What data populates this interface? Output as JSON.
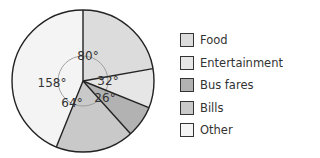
{
  "chart_data": {
    "type": "pie",
    "title": "",
    "unit": "degrees",
    "categories": [
      "Food",
      "Entertainment",
      "Bus fares",
      "Bills",
      "Other"
    ],
    "values": [
      80,
      32,
      26,
      64,
      158
    ],
    "labels": [
      "80°",
      "32°",
      "26°",
      "64°",
      "158°"
    ],
    "colors": [
      "#dcdcdc",
      "#e6e6e6",
      "#b2b2b2",
      "#c9c9c9",
      "#f4f4f4"
    ],
    "start_angle": "12 o'clock",
    "direction": "clockwise",
    "legend_position": "right"
  },
  "legend": {
    "items": [
      {
        "label": "Food",
        "color": "#dcdcdc"
      },
      {
        "label": "Entertainment",
        "color": "#e6e6e6"
      },
      {
        "label": "Bus fares",
        "color": "#b2b2b2"
      },
      {
        "label": "Bills",
        "color": "#c9c9c9"
      },
      {
        "label": "Other",
        "color": "#f4f4f4"
      }
    ]
  }
}
